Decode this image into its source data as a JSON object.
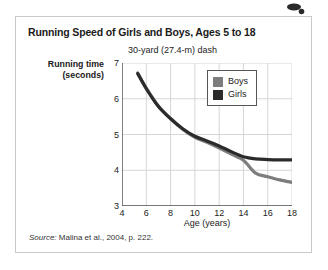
{
  "figure": {
    "title": "Running Speed of Girls and Boys, Ages 5 to 18",
    "subtitle": "30-yard (27.4-m) dash",
    "source_word": "Source:",
    "source_text": " Malina et al., 2004, p. 222."
  },
  "colors": {
    "boys": "#7d7d7d",
    "girls": "#2b2b2b",
    "grid": "#d6d6d6",
    "axis": "#4a4a4a",
    "frame": "#c9c9c9",
    "text": "#1b1b1b"
  },
  "chart_data": {
    "type": "line",
    "title": "Running Speed of Girls and Boys, Ages 5 to 18",
    "subtitle": "30-yard (27.4-m) dash",
    "xlabel": "Age (years)",
    "ylabel": "Running time (seconds)",
    "ylabel_line1": "Running time",
    "ylabel_line2": "(seconds)",
    "xlim": [
      4,
      18
    ],
    "ylim": [
      3,
      7
    ],
    "xticks": [
      4,
      6,
      8,
      10,
      12,
      14,
      16,
      18
    ],
    "yticks": [
      3,
      4,
      5,
      6,
      7
    ],
    "grid": true,
    "legend_position": "top-right",
    "x": [
      5.3,
      6,
      7,
      8,
      9,
      10,
      11,
      12,
      13,
      14,
      15,
      16,
      17,
      18
    ],
    "series": [
      {
        "name": "Boys",
        "color": "#7d7d7d",
        "values": [
          6.72,
          6.3,
          5.8,
          5.45,
          5.15,
          4.92,
          4.78,
          4.62,
          4.45,
          4.28,
          3.92,
          3.82,
          3.73,
          3.66
        ]
      },
      {
        "name": "Girls",
        "color": "#2b2b2b",
        "values": [
          6.7,
          6.28,
          5.78,
          5.44,
          5.16,
          4.95,
          4.82,
          4.68,
          4.52,
          4.38,
          4.32,
          4.3,
          4.29,
          4.29
        ]
      }
    ]
  }
}
